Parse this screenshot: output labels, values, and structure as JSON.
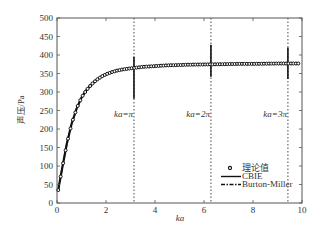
{
  "chart_data": {
    "type": "line",
    "title": "",
    "xlabel": "ka",
    "ylabel": "声压/Pa",
    "xlim": [
      0,
      10
    ],
    "ylim": [
      0,
      500
    ],
    "xticks": [
      0,
      2,
      4,
      6,
      8,
      10
    ],
    "yticks": [
      0,
      50,
      100,
      150,
      200,
      250,
      300,
      350,
      400,
      450,
      500
    ],
    "grid": false,
    "legend_position": "lower right",
    "legend": [
      "理论值",
      "CBIE",
      "Burton-Miller"
    ],
    "series": [
      {
        "name": "理论值",
        "style": "circle markers",
        "x": [
          0.05,
          0.2,
          0.4,
          0.6,
          0.8,
          1.0,
          1.2,
          1.4,
          1.6,
          1.8,
          2.0,
          2.2,
          2.4,
          2.6,
          2.8,
          3.0,
          3.5,
          4.0,
          4.5,
          5.0,
          5.5,
          6.0,
          6.5,
          7.0,
          7.5,
          8.0,
          8.5,
          9.0,
          9.5,
          9.9
        ],
        "y": [
          35,
          90,
          160,
          215,
          255,
          285,
          305,
          320,
          332,
          341,
          348,
          353,
          357,
          360,
          362,
          364,
          368,
          370,
          372,
          373,
          374,
          374.5,
          375,
          375.5,
          376,
          376,
          376.5,
          377,
          377,
          377
        ]
      },
      {
        "name": "CBIE",
        "style": "solid line",
        "x": [
          0.05,
          0.2,
          0.4,
          0.6,
          0.8,
          1.0,
          1.2,
          1.4,
          1.6,
          1.8,
          2.0,
          2.2,
          2.4,
          2.6,
          2.8,
          3.0,
          3.5,
          4.0,
          4.5,
          5.0,
          5.5,
          6.0,
          6.5,
          7.0,
          7.5,
          8.0,
          8.5,
          9.0,
          9.5,
          9.9
        ],
        "y": [
          35,
          90,
          160,
          215,
          255,
          285,
          305,
          320,
          332,
          341,
          348,
          353,
          357,
          360,
          362,
          364,
          368,
          370,
          372,
          373,
          374,
          374.5,
          375,
          375.5,
          376,
          376,
          376.5,
          377,
          377,
          377
        ],
        "spikes": [
          {
            "x": 3.1416,
            "y_min": 282,
            "y_max": 395
          },
          {
            "x": 6.2832,
            "y_min": 341,
            "y_max": 428
          },
          {
            "x": 9.4248,
            "y_min": 335,
            "y_max": 420
          }
        ]
      },
      {
        "name": "Burton-Miller",
        "style": "dash-dot line",
        "x": [
          0.05,
          0.2,
          0.4,
          0.6,
          0.8,
          1.0,
          1.2,
          1.4,
          1.6,
          1.8,
          2.0,
          2.2,
          2.4,
          2.6,
          2.8,
          3.0,
          3.5,
          4.0,
          4.5,
          5.0,
          5.5,
          6.0,
          6.5,
          7.0,
          7.5,
          8.0,
          8.5,
          9.0,
          9.5,
          9.9
        ],
        "y": [
          35,
          90,
          160,
          215,
          255,
          285,
          305,
          320,
          332,
          341,
          348,
          353,
          357,
          360,
          362,
          364,
          368,
          370,
          372,
          373,
          374,
          374.5,
          375,
          375.5,
          376,
          376,
          376.5,
          377,
          377,
          377
        ]
      }
    ],
    "reference_lines": [
      {
        "x": 3.1416,
        "style": "dotted vertical",
        "label": "ka=π"
      },
      {
        "x": 6.2832,
        "style": "dotted vertical",
        "label": "ka=2π"
      },
      {
        "x": 9.4248,
        "style": "dotted vertical",
        "label": "ka=3π"
      }
    ],
    "annotations": [
      {
        "text": "ka=π",
        "x": 3.1416,
        "y": 230
      },
      {
        "text": "ka=2π",
        "x": 6.2832,
        "y": 230
      },
      {
        "text": "ka=3π",
        "x": 9.4248,
        "y": 230
      }
    ]
  },
  "colors": {
    "axis": "#555555",
    "line": "#111111",
    "text": "#333333"
  }
}
